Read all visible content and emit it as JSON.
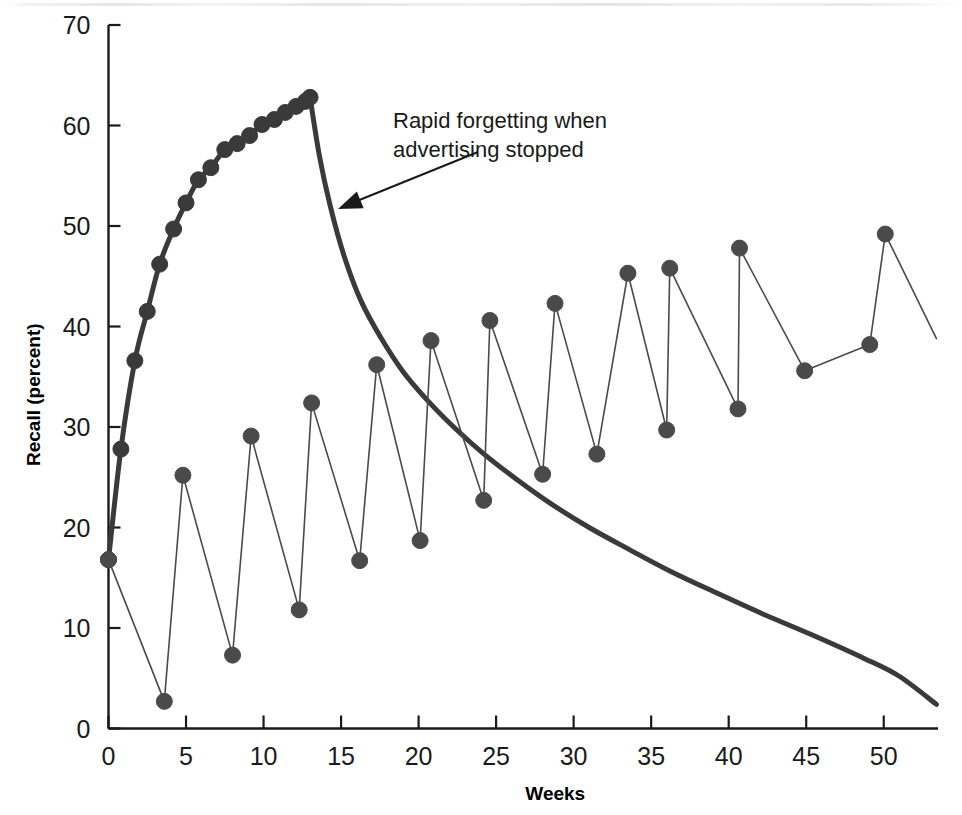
{
  "chart_data": {
    "type": "line",
    "title": "",
    "xlabel": "Weeks",
    "ylabel": "Recall (percent)",
    "xlim": [
      0,
      53.5
    ],
    "ylim": [
      0,
      70
    ],
    "xticks": [
      0,
      5,
      10,
      15,
      20,
      25,
      30,
      35,
      40,
      45,
      50
    ],
    "yticks": [
      0,
      10,
      20,
      30,
      40,
      50,
      60,
      70
    ],
    "xtick_labels": [
      "0",
      "5",
      "10",
      "15",
      "20",
      "25",
      "30",
      "35",
      "40",
      "45",
      "50"
    ],
    "ytick_labels": [
      "0",
      "10",
      "20",
      "30",
      "40",
      "50",
      "60",
      "70"
    ],
    "grid": false,
    "legend": null,
    "series": [
      {
        "name": "Continuous advertising (build-up then forgetting)",
        "style": "thick-line-with-markers",
        "color": "#3a3a3a",
        "marker": "filled-circle",
        "x": [
          0.0,
          0.8,
          1.7,
          2.5,
          3.3,
          4.2,
          5.0,
          5.8,
          6.6,
          7.5,
          8.3,
          9.1,
          9.9,
          10.7,
          11.4,
          12.1,
          12.7,
          13.0
        ],
        "y": [
          16.8,
          27.8,
          36.6,
          41.5,
          46.2,
          49.7,
          52.3,
          54.6,
          55.8,
          57.6,
          58.2,
          59.0,
          60.1,
          60.6,
          61.3,
          61.9,
          62.4,
          62.8
        ]
      },
      {
        "name": "Forgetting decay after advertising stopped",
        "style": "thick-line-no-markers",
        "color": "#3a3a3a",
        "marker": "none",
        "x": [
          13.0,
          13.6,
          14.3,
          15.2,
          16.3,
          17.6,
          19.0,
          20.6,
          22.4,
          24.3,
          26.4,
          28.6,
          31.0,
          33.6,
          36.3,
          39.2,
          42.2,
          45.4,
          48.7,
          51.0,
          53.4
        ],
        "y": [
          62.8,
          57.0,
          52.0,
          47.0,
          42.5,
          38.8,
          35.5,
          32.6,
          29.8,
          27.2,
          24.7,
          22.3,
          20.0,
          17.8,
          15.6,
          13.5,
          11.4,
          9.3,
          7.0,
          5.2,
          2.4
        ]
      },
      {
        "name": "Pulsed advertising (sawtooth)",
        "style": "thin-line-with-markers",
        "color": "#4a4a4a",
        "marker": "filled-circle",
        "x": [
          0.0,
          3.6,
          4.8,
          8.0,
          9.2,
          12.3,
          13.1,
          16.2,
          17.3,
          20.1,
          20.8,
          24.2,
          24.6,
          28.0,
          28.8,
          31.5,
          33.5,
          36.0,
          36.2,
          40.6,
          40.7,
          44.9,
          49.1,
          50.1,
          53.4
        ],
        "y": [
          16.8,
          2.7,
          25.2,
          7.3,
          29.1,
          11.8,
          32.4,
          16.7,
          36.2,
          18.7,
          38.6,
          22.7,
          40.6,
          25.3,
          42.3,
          27.3,
          45.3,
          29.7,
          45.8,
          31.8,
          47.8,
          35.6,
          38.2,
          49.2,
          38.8
        ]
      }
    ],
    "annotations": [
      {
        "name": "rapid-forgetting-note",
        "line1": "Rapid forgetting when",
        "line2": "advertising stopped",
        "text_x": 393,
        "text_y": 128,
        "arrow_from_x": 478,
        "arrow_from_y": 152,
        "arrow_to_x": 338,
        "arrow_to_y": 209
      }
    ],
    "axis_color": "#1a1a1a",
    "background": "#ffffff"
  },
  "axes": {
    "y_title": "Recall (percent)",
    "x_title": "Weeks"
  }
}
